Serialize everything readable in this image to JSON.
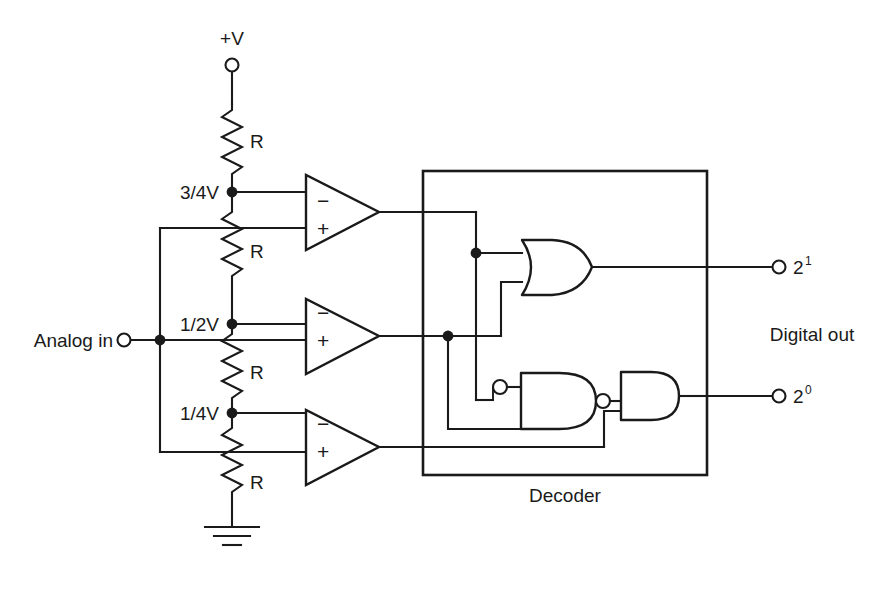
{
  "figure": {
    "type": "circuit-schematic",
    "background_color": "#ffffff",
    "line_color": "#1a1a1a"
  },
  "supply": {
    "label": "+V",
    "terminal_icon": "open-circle-terminal"
  },
  "ladder": {
    "resistor_labels": [
      "R",
      "R",
      "R",
      "R"
    ],
    "taps": [
      {
        "label": "3/4V"
      },
      {
        "label": "1/2V"
      },
      {
        "label": "1/4V"
      }
    ],
    "ground_icon": "ground-symbol"
  },
  "analog_input": {
    "label": "Analog in",
    "terminal_icon": "open-circle-terminal"
  },
  "comparators": [
    {
      "minus": "−",
      "plus": "+"
    },
    {
      "minus": "−",
      "plus": "+"
    },
    {
      "minus": "−",
      "plus": "+"
    }
  ],
  "decoder": {
    "label": "Decoder",
    "gates": [
      {
        "name": "or-gate",
        "type": "OR"
      },
      {
        "name": "nand-gate",
        "type": "NAND-inverted-input"
      },
      {
        "name": "and-gate",
        "type": "AND"
      }
    ]
  },
  "outputs": {
    "group_label": "Digital out",
    "pins": [
      {
        "base": "2",
        "exponent": "1"
      },
      {
        "base": "2",
        "exponent": "0"
      }
    ]
  }
}
